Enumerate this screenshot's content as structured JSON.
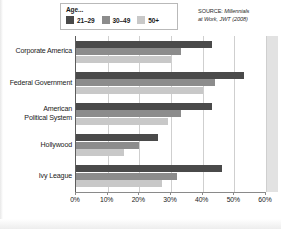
{
  "chart_data": {
    "type": "bar",
    "orientation": "horizontal",
    "title": "",
    "xlabel": "",
    "ylabel": "",
    "xlim": [
      0,
      60
    ],
    "xunit": "%",
    "grid": true,
    "legend_position": "top-left",
    "legend_title": "Age...",
    "categories": [
      "Corporate America",
      "Federal Government",
      "American Political System",
      "Hollywood",
      "Ivy League"
    ],
    "tick_labels": [
      "0%",
      "10%",
      "20%",
      "30%",
      "40%",
      "50%",
      "60%"
    ],
    "tick_values": [
      0,
      10,
      20,
      30,
      40,
      50,
      60
    ],
    "series": [
      {
        "name": "21–29",
        "color": "#4a4a4a",
        "values": [
          43,
          53,
          43,
          26,
          46
        ]
      },
      {
        "name": "30–49",
        "color": "#8c8c8c",
        "values": [
          33,
          44,
          33,
          20,
          32
        ]
      },
      {
        "name": "50+",
        "color": "#c8c8c8",
        "values": [
          30,
          40,
          29,
          15,
          27
        ]
      }
    ],
    "source": {
      "lead": "SOURCE: ",
      "text": "Millennials at Work, JWT (2008)",
      "line1_lead": "SOURCE: ",
      "line1_rest": "Millennials",
      "line2": "at Work, JWT (2008)"
    }
  },
  "legend": {
    "title": "Age...",
    "items": [
      {
        "label": "21–29",
        "color": "#4a4a4a"
      },
      {
        "label": "30–49",
        "color": "#8c8c8c"
      },
      {
        "label": "50+",
        "color": "#c8c8c8"
      }
    ]
  },
  "category_labels": [
    {
      "line1": "Corporate America",
      "line2": ""
    },
    {
      "line1": "Federal Government",
      "line2": ""
    },
    {
      "line1": "American",
      "line2": "Political System"
    },
    {
      "line1": "Hollywood",
      "line2": ""
    },
    {
      "line1": "Ivy League",
      "line2": ""
    }
  ]
}
